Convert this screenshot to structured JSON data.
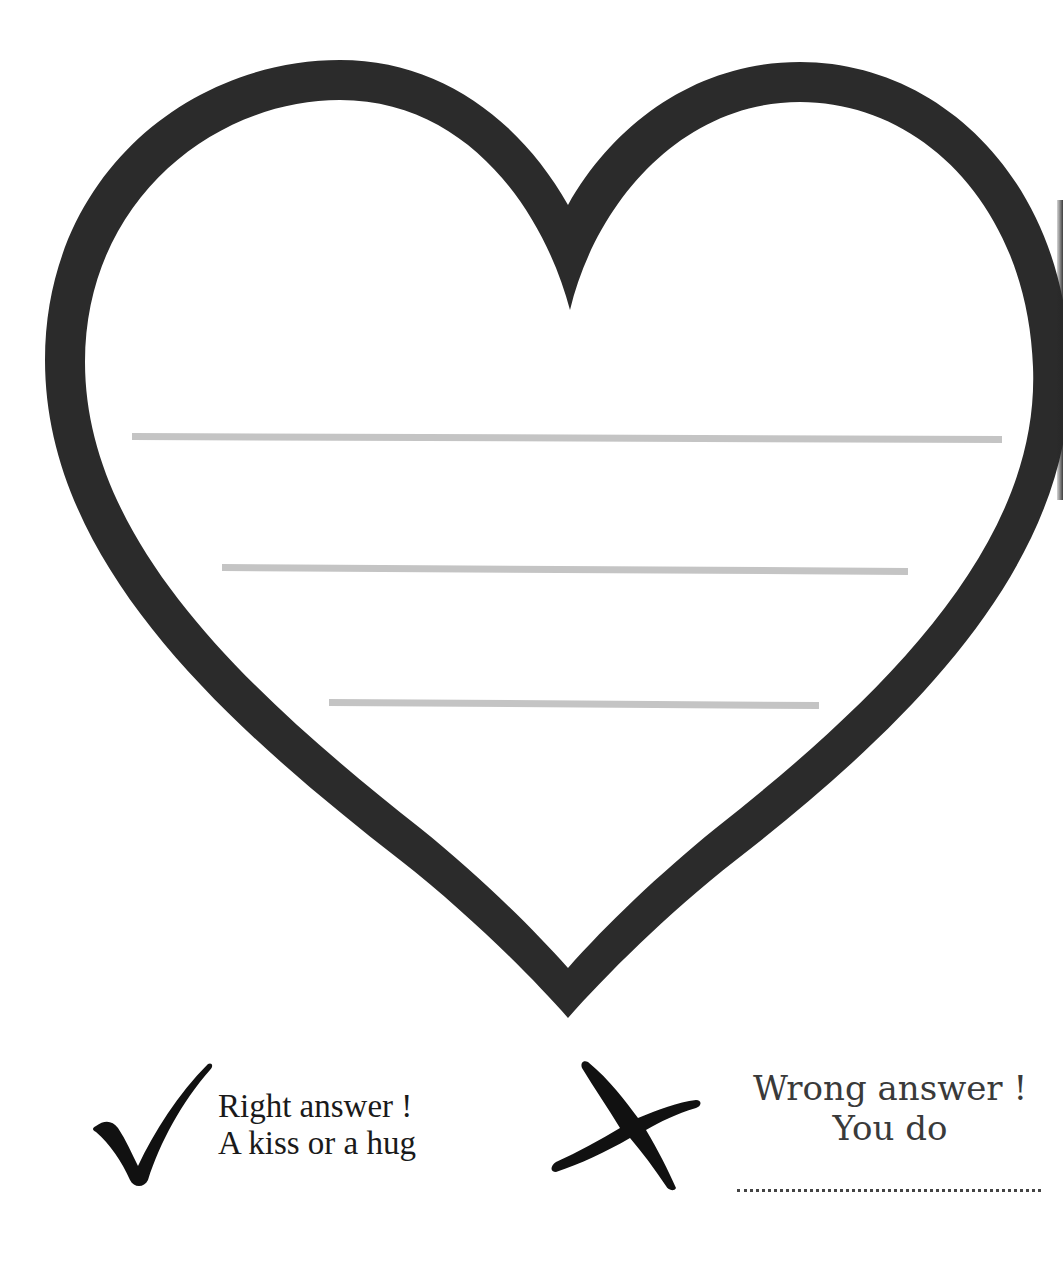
{
  "worksheet": {
    "heart": {
      "outline_color": "#2b2b2b",
      "fill_color": "#ffffff",
      "icon": "heart-outline-icon"
    },
    "answer_lines": [
      {
        "x1": 132,
        "y1": 436,
        "x2": 1002,
        "y2": 439
      },
      {
        "x1": 222,
        "y1": 567,
        "x2": 908,
        "y2": 571
      },
      {
        "x1": 329,
        "y1": 702,
        "x2": 819,
        "y2": 705
      }
    ],
    "answer_line_color": "#c4c4c4",
    "legend": {
      "right": {
        "icon": "checkmark-icon",
        "line1": "Right answer !",
        "line2": "A kiss or a hug"
      },
      "wrong": {
        "icon": "cross-icon",
        "line1": "Wrong answer !",
        "line2": "You do",
        "blank": "...................................."
      }
    }
  }
}
